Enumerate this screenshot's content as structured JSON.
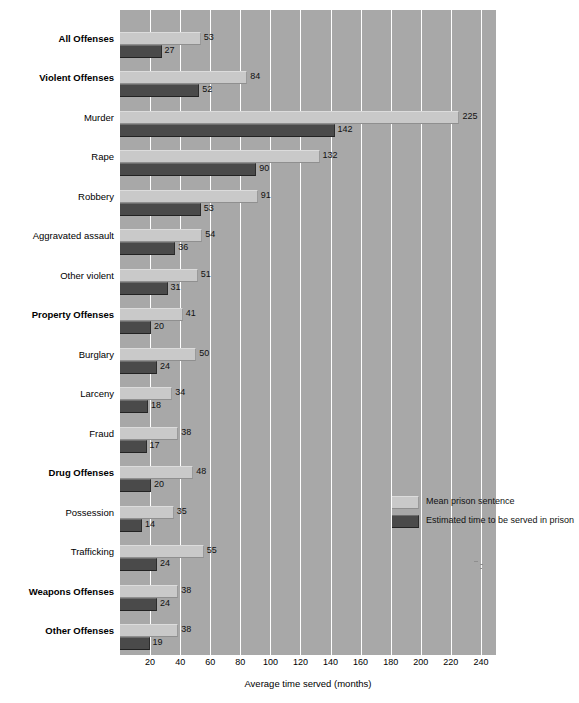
{
  "chart_data": {
    "type": "bar",
    "orientation": "horizontal",
    "title": "",
    "xlabel": "Average time served (months)",
    "ylabel": "",
    "xlim": [
      0,
      250
    ],
    "xticks": [
      20,
      40,
      60,
      80,
      100,
      120,
      140,
      160,
      180,
      200,
      220,
      240
    ],
    "grid": true,
    "legend_position": "middle-right",
    "categories": [
      "All Offenses",
      "Violent Offenses",
      "Murder",
      "Rape",
      "Robbery",
      "Aggravated assault",
      "Other violent",
      "Property Offenses",
      "Burglary",
      "Larceny",
      "Fraud",
      "Drug Offenses",
      "Possession",
      "Trafficking",
      "Weapons Offenses",
      "Other Offenses"
    ],
    "categories_bold": [
      true,
      true,
      false,
      false,
      false,
      false,
      false,
      true,
      false,
      false,
      false,
      true,
      false,
      false,
      true,
      true
    ],
    "series": [
      {
        "name": "Mean prison sentence",
        "color": "#c9c9c9",
        "values": [
          53,
          84,
          225,
          132,
          91,
          54,
          51,
          41,
          50,
          34,
          38,
          48,
          35,
          55,
          38,
          38
        ]
      },
      {
        "name": "Estimated time to be served in prison",
        "color": "#4a4a4a",
        "values": [
          27,
          52,
          142,
          90,
          53,
          36,
          31,
          20,
          24,
          18,
          17,
          20,
          14,
          24,
          24,
          19
        ]
      }
    ]
  }
}
